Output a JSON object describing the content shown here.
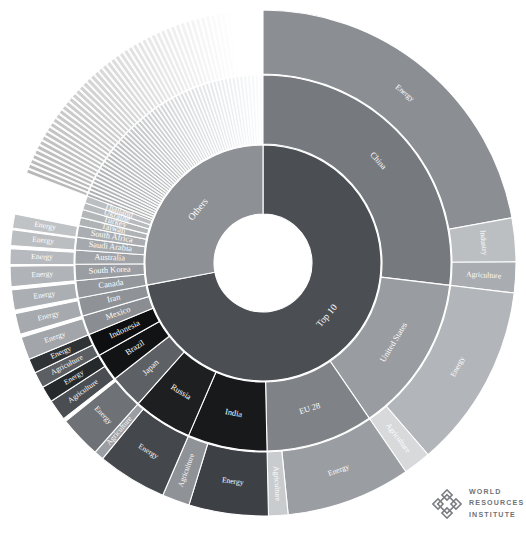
{
  "figure": {
    "center_label": "All Emissions",
    "background_color": "#ffffff",
    "divider_color": "#ffffff"
  },
  "logo": {
    "name": "world-resources-institute",
    "line1": "World",
    "line2": "Resources",
    "line3": "Institute",
    "color": "#6f7377"
  },
  "chart_data": {
    "type": "pie",
    "variant": "sunburst",
    "title": "All Emissions",
    "xlabel": "",
    "ylabel": "",
    "grid": false,
    "legend": "none",
    "rings": [
      "root",
      "group",
      "country",
      "sector"
    ],
    "root": {
      "label": "All Emissions",
      "value": 100,
      "color": "#8d9094"
    },
    "groups": [
      {
        "label": "Top 10",
        "value": 72,
        "color": "#4b4f54",
        "start_deg": 0,
        "end_deg": 259.2
      },
      {
        "label": "Others",
        "value": 28,
        "color": "#8d9094",
        "start_deg": 259.2,
        "end_deg": 360
      }
    ],
    "countries": [
      {
        "name": "China",
        "group": "Top 10",
        "value": 26.0,
        "color": "#76797d",
        "sectors": [
          {
            "label": "Energy",
            "value": 21.4,
            "color": "#8b8e92"
          },
          {
            "label": "Industry",
            "value": 2.7,
            "color": "#bcbfc2"
          },
          {
            "label": "Agriculture",
            "value": 1.9,
            "color": "#a9acb0"
          }
        ]
      },
      {
        "name": "United States",
        "group": "Top 10",
        "value": 13.1,
        "color": "#999ca0",
        "sectors": [
          {
            "label": "Energy",
            "value": 11.4,
            "color": "#b2b5b9"
          },
          {
            "label": "Agriculture",
            "value": 1.7,
            "color": "#d7d9db"
          }
        ]
      },
      {
        "name": "EU 28",
        "group": "Top 10",
        "value": 8.9,
        "color": "#7f8286",
        "sectors": [
          {
            "label": "Energy",
            "value": 7.7,
            "color": "#9a9da1"
          },
          {
            "label": "Agriculture",
            "value": 1.2,
            "color": "#c9ccce"
          }
        ]
      },
      {
        "name": "India",
        "group": "Top 10",
        "value": 6.6,
        "color": "#17191b",
        "sectors": [
          {
            "label": "Energy",
            "value": 4.9,
            "color": "#3d4045"
          },
          {
            "label": "Agriculture",
            "value": 1.7,
            "color": "#8f9296"
          }
        ]
      },
      {
        "name": "Russia",
        "group": "Top 10",
        "value": 4.9,
        "color": "#1d1f21",
        "sectors": [
          {
            "label": "Energy",
            "value": 4.3,
            "color": "#44474b"
          },
          {
            "label": "Agriculture",
            "value": 0.6,
            "color": "#9b9ea2"
          }
        ]
      },
      {
        "name": "Japan",
        "group": "Top 10",
        "value": 2.8,
        "color": "#5d6064",
        "sectors": [
          {
            "label": "Energy",
            "value": 2.6,
            "color": "#6e7175"
          }
        ]
      },
      {
        "name": "Brazil",
        "group": "Top 10",
        "value": 2.3,
        "color": "#111314",
        "sectors": [
          {
            "label": "Agriculture",
            "value": 1.3,
            "color": "#4a4d51"
          },
          {
            "label": "Energy",
            "value": 1.0,
            "color": "#26292c"
          }
        ]
      },
      {
        "name": "Indonesia",
        "group": "Top 10",
        "value": 1.9,
        "color": "#0d0f10",
        "sectors": [
          {
            "label": "Agriculture",
            "value": 1.0,
            "color": "#5b5e62"
          },
          {
            "label": "Energy",
            "value": 0.9,
            "color": "#303336"
          }
        ]
      },
      {
        "name": "Mexico",
        "group": "Top 10",
        "value": 1.6,
        "color": "#8a8d91",
        "sectors": [
          {
            "label": "Energy",
            "value": 1.4,
            "color": "#a2a5a9"
          }
        ]
      },
      {
        "name": "Iran",
        "group": "Top 10",
        "value": 1.5,
        "color": "#8f9296",
        "sectors": [
          {
            "label": "Energy",
            "value": 1.3,
            "color": "#a6a9ad"
          }
        ]
      },
      {
        "name": "Canada",
        "group": "Others",
        "value": 1.5,
        "color": "#94979b",
        "sectors": [
          {
            "label": "Energy",
            "value": 1.3,
            "color": "#abaeb2"
          }
        ]
      },
      {
        "name": "South Korea",
        "group": "Others",
        "value": 1.4,
        "color": "#9a9da1",
        "sectors": [
          {
            "label": "Energy",
            "value": 1.3,
            "color": "#b0b3b7"
          }
        ]
      },
      {
        "name": "Australia",
        "group": "Others",
        "value": 1.2,
        "color": "#a0a3a7",
        "sectors": [
          {
            "label": "Energy",
            "value": 1.0,
            "color": "#b6b9bd"
          }
        ]
      },
      {
        "name": "Saudi Arabia",
        "group": "Others",
        "value": 1.1,
        "color": "#a5a8ac",
        "sectors": [
          {
            "label": "Energy",
            "value": 1.0,
            "color": "#bbbec1"
          }
        ]
      },
      {
        "name": "South Africa",
        "group": "Others",
        "value": 1.0,
        "color": "#aaadb1",
        "sectors": [
          {
            "label": "Energy",
            "value": 0.9,
            "color": "#c0c3c6"
          }
        ]
      },
      {
        "name": "Taiwan",
        "group": "Others",
        "value": 0.7,
        "color": "#b0b3b6",
        "sectors": []
      },
      {
        "name": "Turkey",
        "group": "Others",
        "value": 0.7,
        "color": "#b4b7ba",
        "sectors": []
      },
      {
        "name": "Ukraine",
        "group": "Others",
        "value": 0.6,
        "color": "#b8bbbe",
        "sectors": []
      },
      {
        "name": "Thailand",
        "group": "Others",
        "value": 0.6,
        "color": "#bcbfc2",
        "sectors": []
      }
    ],
    "other_countries_note": "remaining countries shown as many thin unlabeled slivers",
    "sector_labels": [
      "Energy",
      "Industry",
      "Agriculture"
    ]
  }
}
